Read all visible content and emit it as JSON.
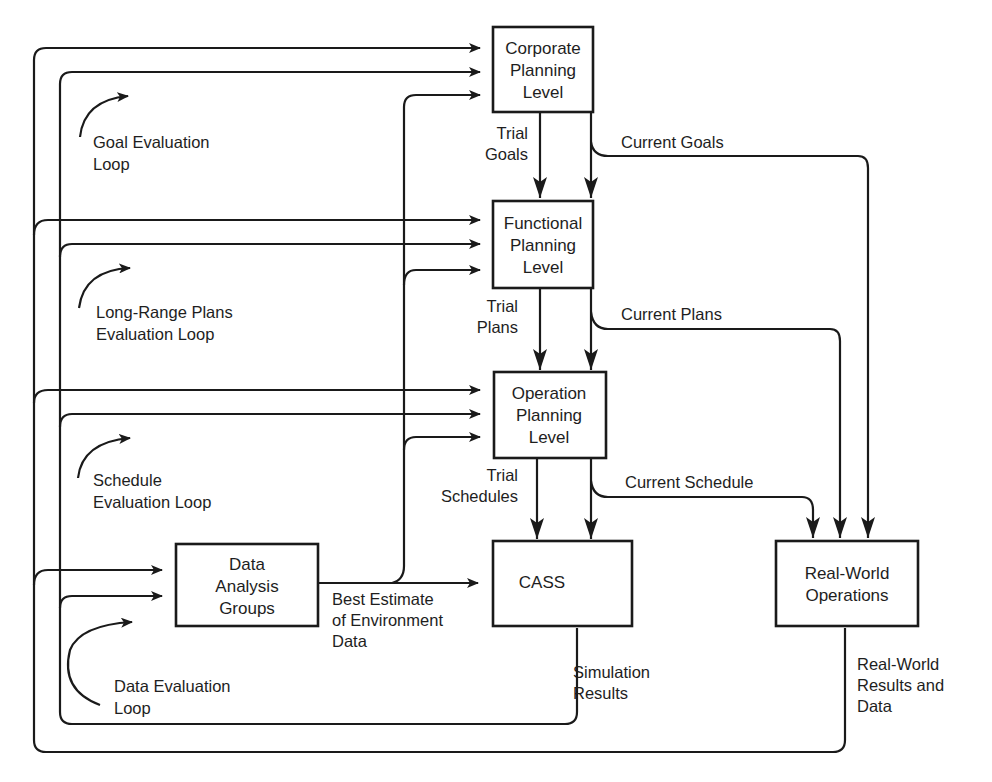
{
  "diagram": {
    "boxes": {
      "corporate": {
        "lines": [
          "Corporate",
          "Planning",
          "Level"
        ]
      },
      "functional": {
        "lines": [
          "Functional",
          "Planning",
          "Level"
        ]
      },
      "operation": {
        "lines": [
          "Operation",
          "Planning",
          "Level"
        ]
      },
      "cass": {
        "lines": [
          "CASS"
        ]
      },
      "data_analysis": {
        "lines": [
          "Data",
          "Analysis",
          "Groups"
        ]
      },
      "real_world": {
        "lines": [
          "Real-World",
          "Operations"
        ]
      }
    },
    "edge_labels": {
      "trial_goals": [
        "Trial",
        "Goals"
      ],
      "current_goals": [
        "Current Goals"
      ],
      "trial_plans": [
        "Trial",
        "Plans"
      ],
      "current_plans": [
        "Current Plans"
      ],
      "trial_schedules": [
        "Trial",
        "Schedules"
      ],
      "current_schedule": [
        "Current Schedule"
      ],
      "best_estimate": [
        "Best Estimate",
        "of Environment",
        "Data"
      ],
      "simulation_results": [
        "Simulation",
        "Results"
      ],
      "real_world_results": [
        "Real-World",
        "Results and",
        "Data"
      ]
    },
    "loops": {
      "goal": [
        "Goal Evaluation",
        "Loop"
      ],
      "long_range": [
        "Long-Range Plans",
        "Evaluation Loop"
      ],
      "schedule": [
        "Schedule",
        "Evaluation Loop"
      ],
      "data": [
        "Data Evaluation",
        "Loop"
      ]
    },
    "colors": {
      "line": "#1a1a1a",
      "background": "#ffffff"
    }
  }
}
